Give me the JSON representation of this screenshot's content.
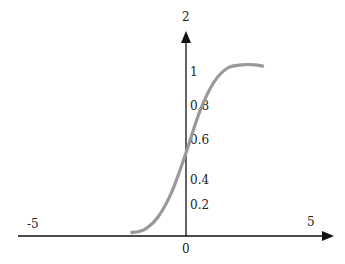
{
  "chart_data": {
    "type": "line",
    "title": "",
    "xlabel": "",
    "ylabel": "",
    "x_ticks": [
      {
        "value": -5,
        "label": "-5"
      },
      {
        "value": 0,
        "label": "0"
      },
      {
        "value": 5,
        "label": "5"
      }
    ],
    "y_ticks": [
      {
        "value": 0.2,
        "label": "0.2"
      },
      {
        "value": 0.4,
        "label": "0.4"
      },
      {
        "value": 0.6,
        "label": "0.6"
      },
      {
        "value": 0.8,
        "label": "0.8"
      },
      {
        "value": 1,
        "label": "1"
      },
      {
        "value": 2,
        "label": "2"
      }
    ],
    "grid": false,
    "legend": "none",
    "series": [
      {
        "name": "sigmoid",
        "color": "#999999",
        "points": [
          {
            "x": -2.0,
            "y": 0.02
          },
          {
            "x": -1.5,
            "y": 0.04
          },
          {
            "x": -1.0,
            "y": 0.12
          },
          {
            "x": -0.5,
            "y": 0.28
          },
          {
            "x": 0.0,
            "y": 0.52
          },
          {
            "x": 0.5,
            "y": 0.78
          },
          {
            "x": 1.0,
            "y": 0.96
          },
          {
            "x": 1.5,
            "y": 1.05
          },
          {
            "x": 2.0,
            "y": 1.07
          },
          {
            "x": 2.5,
            "y": 1.07
          },
          {
            "x": 2.8,
            "y": 1.06
          }
        ]
      }
    ],
    "axis_color": "#111111"
  }
}
